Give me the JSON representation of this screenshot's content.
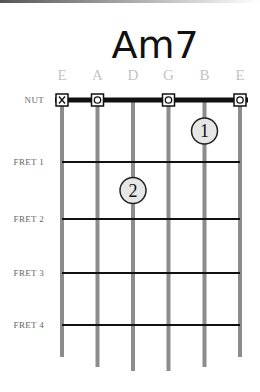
{
  "chord": {
    "name": "Am7",
    "strings": [
      "E",
      "A",
      "D",
      "G",
      "B",
      "E"
    ],
    "nut_label": "NUT",
    "fret_labels": [
      "FRET 1",
      "FRET 2",
      "FRET 3",
      "FRET 4"
    ],
    "open_muted": [
      "X",
      "O",
      "",
      "O",
      "",
      "O"
    ],
    "fingers": [
      {
        "number": "1",
        "string": 5,
        "fret": 1
      },
      {
        "number": "2",
        "string": 3,
        "fret": 2
      }
    ]
  },
  "colors": {
    "string": "#8c8c8c",
    "fret": "#111111",
    "nut": "#111111",
    "finger_fill": "#e6e6e6",
    "string_name": "#c4c4c4"
  }
}
